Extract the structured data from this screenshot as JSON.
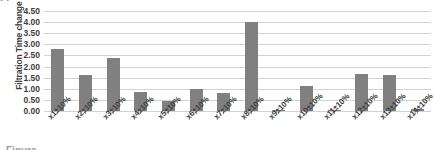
{
  "crop": {
    "top_text": "•                                                                                                                                                                                                                                         •",
    "bottom_text": "Figure"
  },
  "chart_data": {
    "type": "bar",
    "title": "",
    "xlabel": "",
    "ylabel": "Filtration Time change (%)",
    "categories": [
      "x1±10%",
      "x2±10%",
      "x3±10%",
      "x4±10%",
      "x5±10%",
      "x6±10%",
      "x7±10%",
      "x8±10%",
      "x9±10%",
      "x10±10%",
      "x11±10%",
      "x12±10%",
      "x13±10%",
      "x14±10%"
    ],
    "values": [
      2.8,
      1.6,
      2.4,
      0.87,
      0.44,
      1.0,
      0.82,
      4.0,
      0.05,
      1.12,
      0.03,
      1.68,
      1.6,
      0.08
    ],
    "ylim": [
      0.0,
      4.5
    ],
    "ytick_step": 0.5,
    "ytick_labels": [
      "4.50",
      "4.00",
      "3.50",
      "3.00",
      "2.50",
      "2.00",
      "1.50",
      "1.00",
      "0.50",
      "0.00"
    ],
    "grid": true,
    "legend": false,
    "bar_color": "#808080",
    "gridline_color": "#d2d2d2",
    "axis_color": "#b4b4b4",
    "background_color": "#ffffff"
  }
}
